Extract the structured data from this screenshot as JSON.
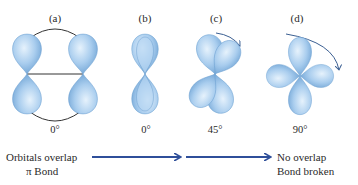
{
  "figure": {
    "panels": [
      {
        "label": "(a)",
        "angle": "0°"
      },
      {
        "label": "(b)",
        "angle": "0°"
      },
      {
        "label": "(c)",
        "angle": "45°"
      },
      {
        "label": "(d)",
        "angle": "90°"
      }
    ],
    "captions": {
      "left_line1": "Orbitals overlap",
      "left_line2": "π Bond",
      "right_line1": "No overlap",
      "right_line2": "Bond broken"
    },
    "colors": {
      "orbital_fill": "#9ec6ea",
      "orbital_edge": "#5f95c8",
      "arrow": "#2f4f9a",
      "bond_line": "#333333",
      "rotation_arrow": "#3b5f92"
    }
  }
}
